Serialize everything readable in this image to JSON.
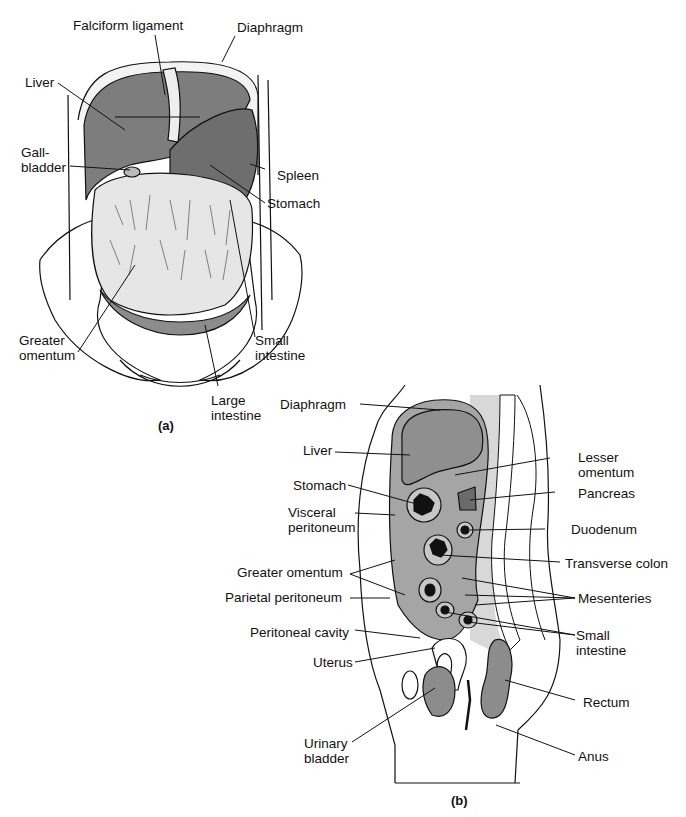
{
  "panel_a": {
    "caption": "(a)",
    "labels": {
      "falciform": "Falciform ligament",
      "diaphragm": "Diaphragm",
      "liver": "Liver",
      "gallbladder": "Gall-\nbladder",
      "spleen": "Spleen",
      "stomach": "Stomach",
      "greater_omentum": "Greater\nomentum",
      "small_intestine": "Small\nintestine",
      "large_intestine": "Large\nintestine"
    }
  },
  "panel_b": {
    "caption": "(b)",
    "labels": {
      "diaphragm": "Diaphragm",
      "liver": "Liver",
      "stomach": "Stomach",
      "visceral_peritoneum": "Visceral\nperitoneum",
      "greater_omentum": "Greater omentum",
      "parietal_peritoneum": "Parietal peritoneum",
      "peritoneal_cavity": "Peritoneal cavity",
      "uterus": "Uterus",
      "urinary_bladder": "Urinary\nbladder",
      "lesser_omentum": "Lesser\nomentum",
      "pancreas": "Pancreas",
      "duodenum": "Duodenum",
      "transverse_colon": "Transverse colon",
      "mesenteries": "Mesenteries",
      "small_intestine": "Small\nintestine",
      "rectum": "Rectum",
      "anus": "Anus"
    }
  },
  "colors": {
    "organ_gray": "#8a8a8a",
    "cavity_gray": "#a8a8a8",
    "light_gray": "#d6d6d6",
    "line": "#111111"
  }
}
